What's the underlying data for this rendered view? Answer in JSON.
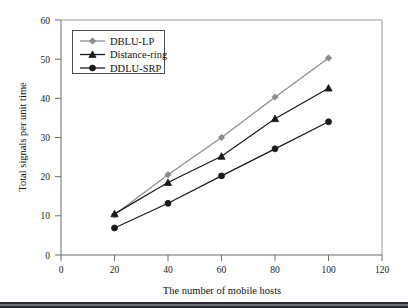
{
  "chart_data": {
    "type": "line",
    "title": "",
    "xlabel": "The number of mobile hosts",
    "ylabel": "Total signals per unit time",
    "x": [
      20,
      40,
      60,
      80,
      100
    ],
    "xlim": [
      0,
      120
    ],
    "ylim": [
      0,
      60
    ],
    "xticks": [
      0,
      20,
      40,
      60,
      80,
      100,
      120
    ],
    "yticks": [
      0,
      10,
      20,
      30,
      40,
      50,
      60
    ],
    "grid": false,
    "legend_position": "upper left",
    "series": [
      {
        "name": "DBLU-LP",
        "values": [
          10.3,
          20.5,
          30.0,
          40.3,
          50.3
        ],
        "color": "#8c8c8c",
        "marker": "diamond"
      },
      {
        "name": "Distance-ring",
        "values": [
          10.5,
          18.5,
          25.2,
          34.8,
          42.6
        ],
        "color": "#1a1a1a",
        "marker": "triangle"
      },
      {
        "name": "DDLU-SRP",
        "values": [
          6.9,
          13.2,
          20.2,
          27.1,
          34.0
        ],
        "color": "#1a1a1a",
        "marker": "circle"
      }
    ]
  },
  "axes": {
    "x_tick_labels": [
      "0",
      "20",
      "40",
      "60",
      "80",
      "100",
      "120"
    ],
    "y_tick_labels": [
      "0",
      "10",
      "20",
      "30",
      "40",
      "50",
      "60"
    ],
    "x_axis_title": "The number of mobile hosts",
    "y_axis_title": "Total signals per unit time"
  },
  "legend": {
    "entries": [
      {
        "label": "DBLU-LP"
      },
      {
        "label": "Distance-ring"
      },
      {
        "label": "DDLU-SRP"
      }
    ]
  },
  "colors": {
    "series_1": "#8c8c8c",
    "series_2": "#1a1a1a",
    "series_3": "#1a1a1a",
    "frame": "#9a9a9a",
    "axis": "#6b6b6b",
    "footer": "#2b2b33"
  }
}
